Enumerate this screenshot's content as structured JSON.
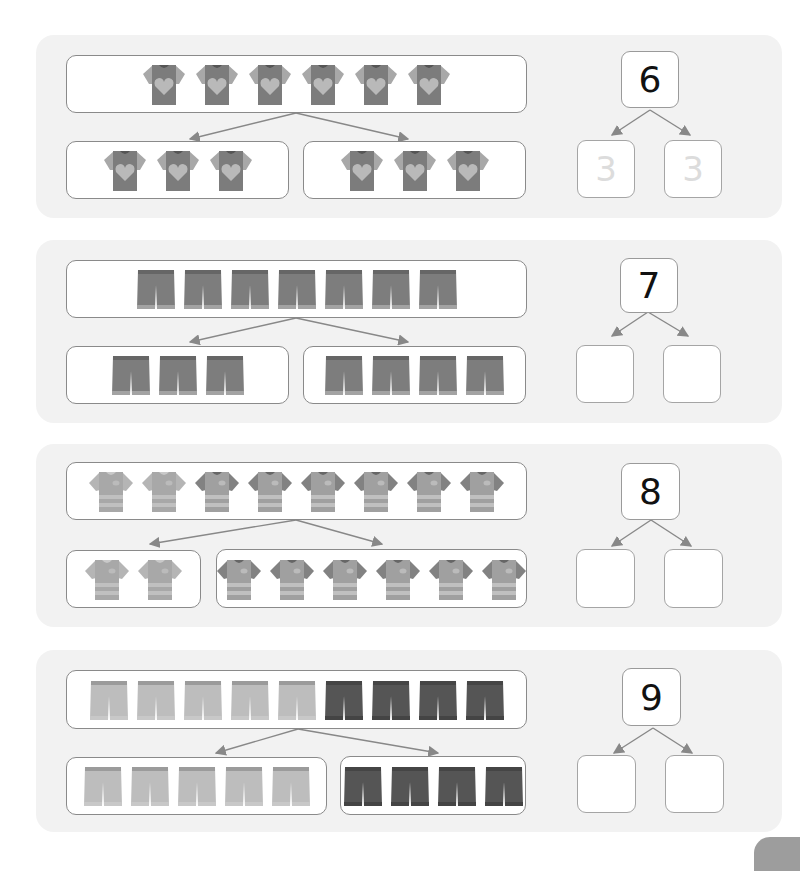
{
  "worksheet": {
    "rows": [
      {
        "total": "6",
        "item_type": "heart-tshirt",
        "top_count": 6,
        "left_count": 3,
        "right_count": 3,
        "left_answer": "3",
        "right_answer": "3",
        "colors": {
          "body": "#7c7c7c",
          "sleeve": "#a8a8a8",
          "accent": "#b9b9b9"
        }
      },
      {
        "total": "7",
        "item_type": "shorts",
        "top_count": 7,
        "left_count": 3,
        "right_count": 4,
        "left_answer": "",
        "right_answer": "",
        "colors": {
          "body": "#7d7d7d",
          "hem": "#a3a3a3"
        }
      },
      {
        "total": "8",
        "item_type": "striped-tshirt",
        "top_count": 8,
        "left_count": 2,
        "right_count": 6,
        "left_answer": "",
        "right_answer": "",
        "colors": {
          "light_sleeve": "#b5b5b5",
          "dark_sleeve": "#828282",
          "body": "#a0a0a0"
        }
      },
      {
        "total": "9",
        "item_type": "shorts-two-tone",
        "top_count": 9,
        "left_count": 5,
        "right_count": 4,
        "left_answer": "",
        "right_answer": "",
        "colors": {
          "light": "#bdbdbd",
          "dark": "#555555"
        }
      }
    ]
  }
}
